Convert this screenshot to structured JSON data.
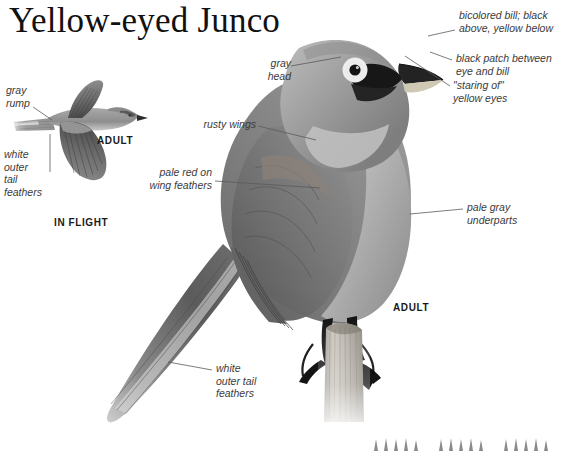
{
  "page": {
    "title": "Yellow-eyed Junco",
    "background_color": "#ffffff",
    "ink_color": "#3b3b3b"
  },
  "annotations": {
    "gray_head": "gray\nhead",
    "rusty_wings": "rusty wings",
    "pale_red_wing": "pale red on\nwing feathers",
    "bicolored_bill": "bicolored bill; black\nabove, yellow below",
    "black_patch": "black patch between\neye and bill",
    "staring_eyes": "\"staring of\"\nyellow eyes",
    "pale_gray_underparts": "pale gray\nunderparts",
    "white_outer_tail_main": "white\nouter tail\nfeathers",
    "gray_rump": "gray\nrump",
    "white_outer_tail_flight": "white\nouter\ntail\nfeathers"
  },
  "captions": {
    "adult_flight": "ADULT",
    "in_flight": "IN FLIGHT",
    "adult_perched": "ADULT"
  },
  "figure": {
    "perched_bird_name": "yellow-eyed-junco-perched-illustration",
    "flight_bird_name": "yellow-eyed-junco-in-flight-illustration",
    "perch_name": "wooden-fence-post",
    "grass_name": "grass-tuft"
  }
}
